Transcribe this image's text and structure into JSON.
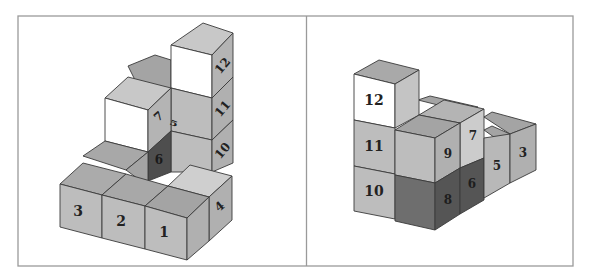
{
  "figure": {
    "type": "isometric-cube-views"
  },
  "colors": {
    "frame": "#9a9a9a",
    "edge": "#3a3a3a",
    "white_face": "#ffffff",
    "light_top": "#c9c9c9",
    "mid_top": "#a9a9a9",
    "front_gray": "#bdbdbd",
    "side_gray": "#b0b0b0",
    "dark_front": "#6e6e6e",
    "dark_side": "#555555",
    "label": "#222222"
  },
  "left_view": {
    "labels": {
      "c1": "1",
      "c2": "2",
      "c3": "3",
      "c4": "4",
      "c5": "5",
      "c6": "6",
      "c7": "7",
      "c10": "10",
      "c11": "11",
      "c12": "12"
    }
  },
  "right_view": {
    "labels": {
      "c3": "3",
      "c5": "5",
      "c6": "6",
      "c7": "7",
      "c8": "8",
      "c9": "9",
      "c10": "10",
      "c11": "11",
      "c12": "12"
    }
  }
}
